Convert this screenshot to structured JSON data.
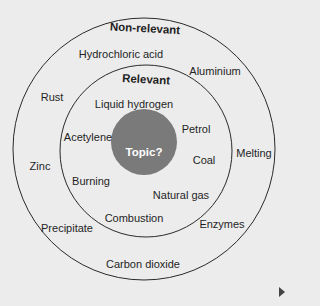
{
  "diagram": {
    "center": {
      "label": "Topic?",
      "fill": "#7a7a7a"
    },
    "inner_ring": {
      "heading": "Relevant",
      "items": [
        "Liquid hydrogen",
        "Acetylene",
        "Petrol",
        "Coal",
        "Burning",
        "Natural gas",
        "Combustion"
      ]
    },
    "outer_ring": {
      "heading": "Non-relevant",
      "items": [
        "Hydrochloric acid",
        "Aluminium",
        "Rust",
        "Melting",
        "Zinc",
        "Enzymes",
        "Precipitate",
        "Carbon dioxide"
      ]
    },
    "colors": {
      "background": "#ececec",
      "stroke": "#2a2a2a",
      "topic_fill": "#7a7a7a"
    }
  },
  "navigation": {
    "next_icon": "play-triangle-right"
  }
}
